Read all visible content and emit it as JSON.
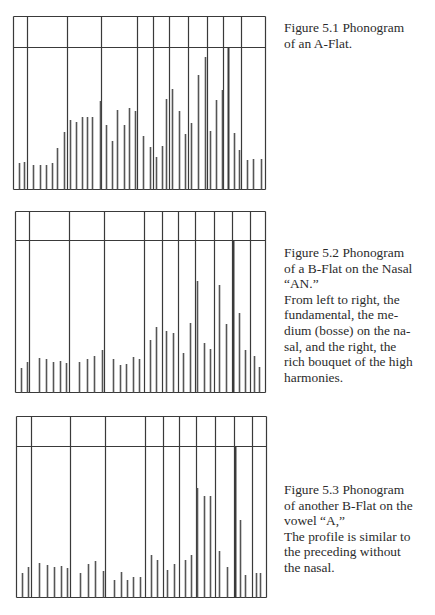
{
  "figures": [
    {
      "id": "5.1",
      "caption_lines": [
        "Figure 5.1 Phonogram",
        "of an A-Flat."
      ],
      "caption_top": 20,
      "box": {
        "left": 13,
        "top": 16,
        "right": 265,
        "bottom": 189,
        "header": 47
      },
      "dividers": [
        27,
        67,
        101,
        137,
        153,
        169,
        188,
        207,
        223,
        241
      ],
      "thick_divider": 228,
      "spikes": [
        [
          19,
          163
        ],
        [
          24,
          162
        ],
        [
          33,
          165
        ],
        [
          40,
          165
        ],
        [
          46,
          165
        ],
        [
          52,
          163
        ],
        [
          57,
          148
        ],
        [
          64,
          132
        ],
        [
          70,
          120
        ],
        [
          76,
          122
        ],
        [
          82,
          117
        ],
        [
          87,
          117
        ],
        [
          92,
          117
        ],
        [
          100,
          101
        ],
        [
          106,
          125
        ],
        [
          112,
          141
        ],
        [
          117,
          110
        ],
        [
          124,
          125
        ],
        [
          129,
          108
        ],
        [
          135,
          111
        ],
        [
          143,
          136
        ],
        [
          150,
          147
        ],
        [
          156,
          157
        ],
        [
          162,
          146
        ],
        [
          166,
          99
        ],
        [
          172,
          89
        ],
        [
          179,
          111
        ],
        [
          185,
          134
        ],
        [
          191,
          123
        ],
        [
          198,
          75
        ],
        [
          205,
          57
        ],
        [
          210,
          131
        ],
        [
          216,
          100
        ],
        [
          222,
          90
        ],
        [
          234,
          133
        ],
        [
          239,
          150
        ],
        [
          247,
          160
        ],
        [
          253,
          159
        ],
        [
          261,
          159
        ]
      ]
    },
    {
      "id": "5.2",
      "caption_lines": [
        "Figure 5.2 Phonogram",
        "of a B-Flat on the Nasal",
        "“AN.”",
        "From left to right, the",
        "fundamental, the me-",
        "dium (bosse) on the na-",
        "sal, and the right, the",
        "rich bouquet of the high",
        "harmonies."
      ],
      "caption_top": 245,
      "box": {
        "left": 15,
        "top": 211,
        "right": 265,
        "bottom": 392,
        "header": 240
      },
      "dividers": [
        29,
        69,
        104,
        144,
        162,
        178,
        195,
        214,
        232,
        250
      ],
      "thick_divider": 233,
      "spikes": [
        [
          21,
          368
        ],
        [
          27,
          362
        ],
        [
          39,
          358
        ],
        [
          46,
          359
        ],
        [
          53,
          362
        ],
        [
          60,
          361
        ],
        [
          66,
          363
        ],
        [
          79,
          362
        ],
        [
          87,
          359
        ],
        [
          94,
          356
        ],
        [
          102,
          350
        ],
        [
          113,
          359
        ],
        [
          120,
          365
        ],
        [
          126,
          364
        ],
        [
          133,
          357
        ],
        [
          139,
          359
        ],
        [
          150,
          340
        ],
        [
          156,
          327
        ],
        [
          166,
          331
        ],
        [
          173,
          333
        ],
        [
          183,
          353
        ],
        [
          190,
          323
        ],
        [
          197,
          281
        ],
        [
          204,
          343
        ],
        [
          210,
          349
        ],
        [
          219,
          285
        ],
        [
          226,
          324
        ],
        [
          239,
          313
        ],
        [
          245,
          350
        ],
        [
          254,
          356
        ],
        [
          259,
          367
        ]
      ]
    },
    {
      "id": "5.3",
      "caption_lines": [
        "Figure 5.3 Phonogram",
        "of another B-Flat on the",
        "vowel “A,”",
        "The profile is similar to",
        "the preceding without",
        "the nasal."
      ],
      "caption_top": 482,
      "box": {
        "left": 16,
        "top": 416,
        "right": 266,
        "bottom": 597,
        "header": 446
      },
      "dividers": [
        31,
        70,
        105,
        145,
        163,
        179,
        196,
        215,
        234,
        252
      ],
      "thick_divider": 235,
      "spikes": [
        [
          22,
          573
        ],
        [
          28,
          567
        ],
        [
          39,
          563
        ],
        [
          47,
          565
        ],
        [
          54,
          567
        ],
        [
          61,
          566
        ],
        [
          67,
          568
        ],
        [
          80,
          573
        ],
        [
          88,
          564
        ],
        [
          95,
          561
        ],
        [
          103,
          571
        ],
        [
          114,
          580
        ],
        [
          121,
          572
        ],
        [
          127,
          580
        ],
        [
          133,
          577
        ],
        [
          140,
          577
        ],
        [
          151,
          555
        ],
        [
          157,
          560
        ],
        [
          167,
          570
        ],
        [
          174,
          564
        ],
        [
          185,
          560
        ],
        [
          191,
          555
        ],
        [
          197,
          488
        ],
        [
          204,
          496
        ],
        [
          210,
          496
        ],
        [
          219,
          551
        ],
        [
          227,
          567
        ],
        [
          240,
          520
        ],
        [
          245,
          575
        ],
        [
          256,
          573
        ],
        [
          260,
          573
        ]
      ]
    }
  ],
  "colors": {
    "line": "#3a3a3a",
    "spike": "#555555",
    "text": "#2b2b2b"
  }
}
